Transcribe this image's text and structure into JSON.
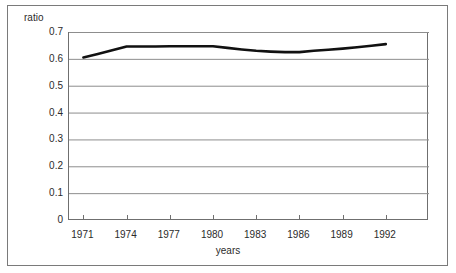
{
  "chart_data": {
    "type": "line",
    "title": "",
    "xlabel": "years",
    "ylabel": "ratio",
    "grid": "horizontal",
    "legend": "none",
    "xlim": [
      1970,
      1995
    ],
    "ylim": [
      0,
      0.7
    ],
    "ytick_labels": [
      "0.7",
      "0.6",
      "0.5",
      "0.4",
      "0.3",
      "0.2",
      "0.1",
      "0"
    ],
    "ytick_values": [
      0.7,
      0.6,
      0.5,
      0.4,
      0.3,
      0.2,
      0.1,
      0
    ],
    "xtick_labels": [
      "1971",
      "1974",
      "1977",
      "1980",
      "1983",
      "1986",
      "1989",
      "1992"
    ],
    "xtick_values": [
      1971,
      1974,
      1977,
      1980,
      1983,
      1986,
      1989,
      1992
    ],
    "series": [
      {
        "name": "ratio",
        "color": "#111111",
        "x": [
          1971,
          1972,
          1973,
          1974,
          1975,
          1976,
          1977,
          1978,
          1979,
          1980,
          1981,
          1982,
          1983,
          1984,
          1985,
          1986,
          1987,
          1988,
          1989,
          1990,
          1991,
          1992
        ],
        "values": [
          0.605,
          0.618,
          0.632,
          0.646,
          0.646,
          0.646,
          0.647,
          0.647,
          0.647,
          0.647,
          0.641,
          0.635,
          0.63,
          0.627,
          0.625,
          0.625,
          0.63,
          0.634,
          0.638,
          0.643,
          0.649,
          0.655
        ]
      }
    ]
  }
}
